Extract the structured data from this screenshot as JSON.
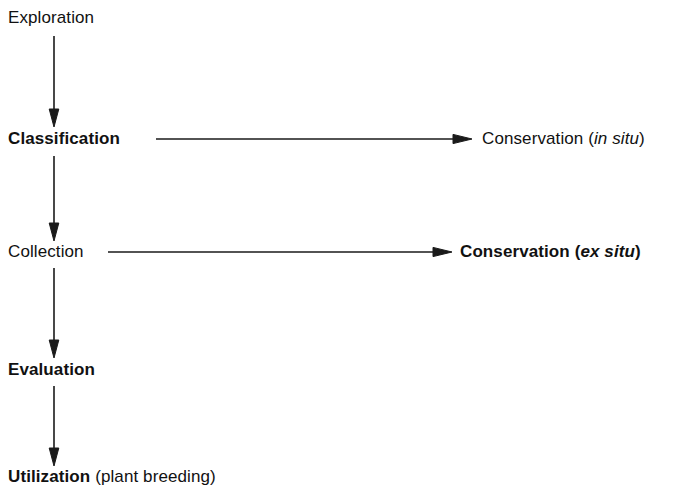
{
  "diagram": {
    "background_color": "#ffffff",
    "ink_color": "#1a1a1a",
    "nodes": [
      {
        "id": "exploration",
        "label": "Exploration",
        "weight": "regular",
        "x": 8,
        "y": 8
      },
      {
        "id": "classification",
        "label": "Classification",
        "weight": "bold",
        "x": 8,
        "y": 129
      },
      {
        "id": "conservation-in-situ",
        "label": "Conservation (in situ)",
        "label_plain": "Conservation (",
        "label_italic": "in situ",
        "label_close": ")",
        "weight": "regular",
        "x": 482,
        "y": 129
      },
      {
        "id": "collection",
        "label": "Collection",
        "weight": "regular",
        "x": 8,
        "y": 242
      },
      {
        "id": "conservation-ex-situ",
        "label": "Conservation (ex situ)",
        "label_plain": "Conservation (",
        "label_italic": "ex situ",
        "label_close": ")",
        "weight": "bold",
        "x": 460,
        "y": 242
      },
      {
        "id": "evaluation",
        "label": "Evaluation",
        "weight": "bold",
        "x": 8,
        "y": 360
      },
      {
        "id": "utilization",
        "label": "Utilization (plant breeding)",
        "label_bold": "Utilization",
        "label_tail": " (plant breeding)",
        "weight": "bold",
        "x": 8,
        "y": 467
      }
    ],
    "arrows": [
      {
        "id": "exploration-to-classification",
        "orientation": "vertical",
        "from": "exploration",
        "to": "classification",
        "x": 54,
        "y1": 36,
        "y2": 126
      },
      {
        "id": "classification-to-conservation-in-situ",
        "orientation": "horizontal",
        "from": "classification",
        "to": "conservation-in-situ",
        "y": 139,
        "x1": 156,
        "x2": 472
      },
      {
        "id": "classification-to-collection",
        "orientation": "vertical",
        "from": "classification",
        "to": "collection",
        "x": 54,
        "y1": 156,
        "y2": 240
      },
      {
        "id": "collection-to-conservation-ex-situ",
        "orientation": "horizontal",
        "from": "collection",
        "to": "conservation-ex-situ",
        "y": 252,
        "x1": 108,
        "x2": 452
      },
      {
        "id": "collection-to-evaluation",
        "orientation": "vertical",
        "from": "collection",
        "to": "evaluation",
        "x": 54,
        "y1": 268,
        "y2": 357
      },
      {
        "id": "evaluation-to-utilization",
        "orientation": "vertical",
        "from": "evaluation",
        "to": "utilization",
        "x": 54,
        "y1": 386,
        "y2": 465
      }
    ]
  }
}
